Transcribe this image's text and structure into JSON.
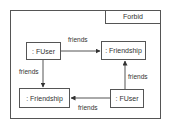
{
  "diagram": {
    "frame_label": "Forbid",
    "nodes": [
      {
        "id": "fuser1",
        "label": ": FUser"
      },
      {
        "id": "friendship1",
        "label": ": Friendship"
      },
      {
        "id": "friendship2",
        "label": ": Friendship"
      },
      {
        "id": "fuser2",
        "label": ": FUser"
      }
    ],
    "edges": [
      {
        "from": "fuser1",
        "to": "friendship1",
        "label": "friends"
      },
      {
        "from": "fuser1",
        "to": "friendship2",
        "label": "friends"
      },
      {
        "from": "fuser2",
        "to": "friendship1",
        "label": "friends"
      },
      {
        "from": "fuser2",
        "to": "friendship2",
        "label": "friends"
      }
    ],
    "colors": {
      "stroke": "#555555",
      "text": "#333333",
      "background": "#ffffff"
    }
  }
}
